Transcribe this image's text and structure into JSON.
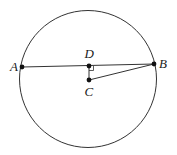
{
  "diagram": {
    "type": "circle-chord-geometry",
    "circle": {
      "center": [
        88,
        79
      ],
      "r": 69
    },
    "points": {
      "A": {
        "label": "A",
        "x": 22,
        "y": 67
      },
      "B": {
        "label": "B",
        "x": 154,
        "y": 64
      },
      "C": {
        "label": "C",
        "x": 89,
        "y": 80
      },
      "D": {
        "label": "D",
        "x": 89,
        "y": 66
      }
    },
    "segments": [
      "AB",
      "DC",
      "CB"
    ],
    "right_angle_at": "D",
    "colors": {
      "stroke": "#333333",
      "point": "#111111"
    }
  }
}
